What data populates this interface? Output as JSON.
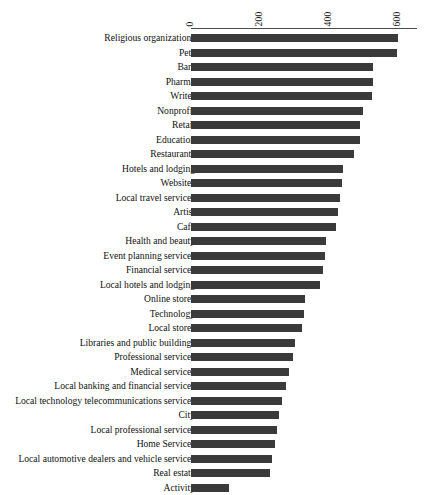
{
  "chart_data": {
    "type": "bar",
    "orientation": "horizontal",
    "title": "",
    "subtitle": "",
    "xlabel": "",
    "ylabel": "",
    "xlim": [
      0,
      655
    ],
    "grid": false,
    "legend": null,
    "axis_ticks": [
      {
        "label": "0",
        "value": 0
      },
      {
        "label": "200",
        "value": 200
      },
      {
        "label": "400",
        "value": 400
      },
      {
        "label": "600",
        "value": 600
      }
    ],
    "tick_label_rotation": 90,
    "bar_color": "#3a3a3a",
    "axis_color": "#4a4a4a",
    "background": "#ffffff",
    "categories": [
      "Religious organizations",
      "Pets",
      "Bars",
      "Pharma",
      "Writer",
      "Nonprofit",
      "Retail",
      "Education",
      "Restaurants",
      "Hotels and lodging",
      "Websites",
      "Local travel services",
      "Artist",
      "Cafe",
      "Health and beauty",
      "Event planning services",
      "Financial services",
      "Local hotels and lodging",
      "Online stores",
      "Technology",
      "Local stores",
      "Libraries and public buildings",
      "Professional services",
      "Medical services",
      "Local banking and financial services",
      "Local technology telecommunications services",
      "City",
      "Local professional services",
      "Home Services",
      "Local automotive dealers and vehicle services",
      "Real estate",
      "Activity"
    ],
    "values": [
      600,
      597,
      528,
      528,
      525,
      499,
      490,
      490,
      472,
      440,
      437,
      432,
      425,
      420,
      392,
      389,
      384,
      375,
      331,
      327,
      322,
      300,
      295,
      283,
      275,
      263,
      255,
      248,
      243,
      235,
      230,
      110
    ]
  }
}
